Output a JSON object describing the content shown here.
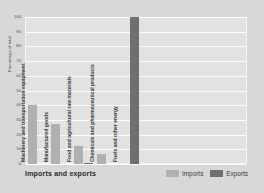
{
  "chart_data": {
    "type": "bar",
    "title": "Imports and exports",
    "xlabel": "",
    "ylabel": "Percentage of total",
    "ylim": [
      0,
      100
    ],
    "yticks": [
      0,
      10,
      20,
      30,
      40,
      50,
      60,
      70,
      80,
      90,
      100
    ],
    "ytick_labels": [
      "0",
      "10",
      "20",
      "30",
      "40",
      "50",
      "60",
      "70",
      "80",
      "90",
      "100"
    ],
    "grid": true,
    "legend_position": "bottom-right",
    "categories": [
      "Machinery and transportation equipment",
      "Manufactured goods",
      "Food and agricultural raw materials",
      "Chemicals and pharmaceutical products",
      "Fuels and other energy"
    ],
    "series": [
      {
        "name": "Imports",
        "color": "#b0b0b0",
        "values": [
          40,
          27,
          12,
          7,
          0
        ]
      },
      {
        "name": "Exports",
        "color": "#6f6f6f",
        "values": [
          0,
          0,
          1,
          0,
          100
        ]
      }
    ]
  },
  "legend": {
    "items": [
      {
        "label": "Imports",
        "color": "#b0b0b0"
      },
      {
        "label": "Exports",
        "color": "#6f6f6f"
      }
    ]
  },
  "colors": {
    "card_background": "#d8d8d8",
    "plot_background": "#e2e2e2",
    "gridline": "#fdfdfd",
    "imports": "#b0b0b0",
    "exports": "#6f6f6f",
    "text": "#3a3a3a"
  }
}
